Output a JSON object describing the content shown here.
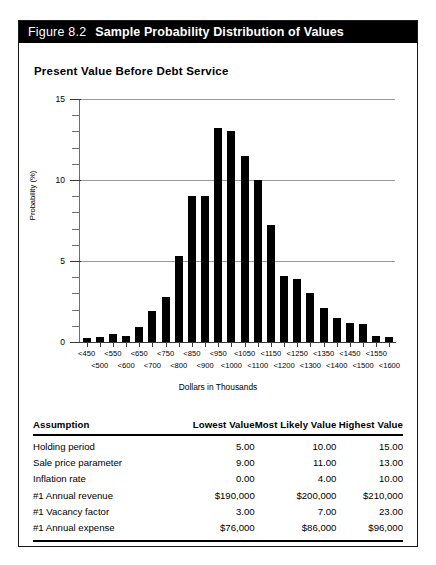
{
  "figure": {
    "number": "Figure 8.2",
    "caption": "Sample Probability Distribution of Values"
  },
  "chart_title": "Present Value Before Debt Service",
  "chart_data": {
    "type": "bar",
    "title": "Present Value Before Debt Service",
    "xlabel": "Dollars in Thousands",
    "ylabel": "Probability (%)",
    "ylim": [
      0,
      15
    ],
    "yticks": [
      0,
      5,
      10,
      15
    ],
    "ytick_labels": [
      "0",
      "5",
      "10",
      "15"
    ],
    "minor_tick_step": 1,
    "grid": "horizontal",
    "legend": "none",
    "categories": [
      "<450",
      "<500",
      "<550",
      "<600",
      "<650",
      "<700",
      "<750",
      "<800",
      "<850",
      "<900",
      "<950",
      "<1000",
      "<1050",
      "<1100",
      "<1150",
      "<1200",
      "<1250",
      "<1300",
      "<1350",
      "<1400",
      "<1450",
      "<1500",
      "<1550",
      "<1600"
    ],
    "categories_row1": [
      "<450",
      "<550",
      "<650",
      "<750",
      "<850",
      "<950",
      "<1050",
      "<1150",
      "<1250",
      "<1350",
      "<1450",
      "<1550"
    ],
    "categories_row2": [
      "<500",
      "<600",
      "<700",
      "<800",
      "<900",
      "<1000",
      "<1100",
      "<1200",
      "<1300",
      "<1400",
      "<1500",
      "<1600"
    ],
    "values": [
      0.25,
      0.3,
      0.5,
      0.35,
      0.9,
      1.9,
      2.8,
      5.3,
      9.0,
      9.0,
      13.2,
      13.0,
      11.5,
      10.0,
      7.2,
      4.1,
      3.9,
      3.0,
      2.1,
      1.5,
      1.2,
      1.1,
      0.35,
      0.3
    ],
    "bar_color": "#000000",
    "grid_color": "#9a9a9a"
  },
  "table": {
    "headers": [
      "Assumption",
      "Lowest Value",
      "Most Likely Value",
      "Highest Value"
    ],
    "rows": [
      {
        "assumption": "Holding period",
        "lowest": "5.00",
        "likely": "10.00",
        "highest": "15.00"
      },
      {
        "assumption": "Sale price parameter",
        "lowest": "9.00",
        "likely": "11.00",
        "highest": "13.00"
      },
      {
        "assumption": "Inflation rate",
        "lowest": "0.00",
        "likely": "4.00",
        "highest": "10.00"
      },
      {
        "assumption": "#1 Annual revenue",
        "lowest": "$190,000",
        "likely": "$200,000",
        "highest": "$210,000"
      },
      {
        "assumption": "#1 Vacancy factor",
        "lowest": "3.00",
        "likely": "7.00",
        "highest": "23.00"
      },
      {
        "assumption": "#1 Annual expense",
        "lowest": "$76,000",
        "likely": "$86,000",
        "highest": "$96,000"
      }
    ]
  }
}
